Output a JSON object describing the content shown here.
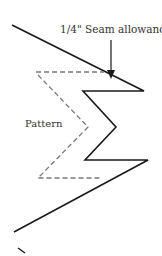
{
  "diagram": {
    "labels": {
      "seam_allowance": "1/4\" Seam allowance",
      "pattern": "Pattern"
    },
    "colors": {
      "seam_line": "#1a1a1a",
      "pattern_line": "#7a7a7a",
      "text": "#333333"
    }
  }
}
